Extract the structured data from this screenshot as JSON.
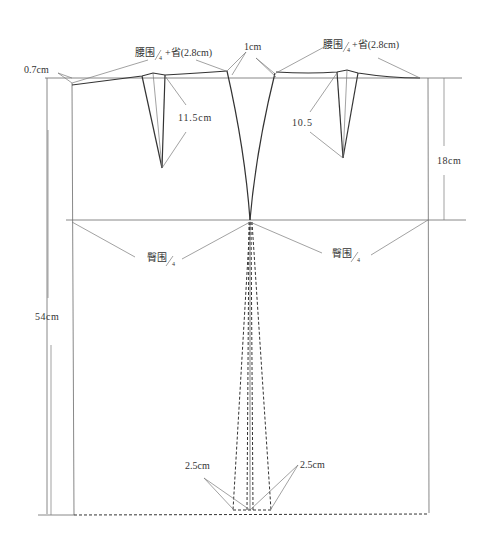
{
  "diagram": {
    "type": "skirt-pattern-draft",
    "colors": {
      "line": "#6a6a6a",
      "bold_line": "#333333",
      "text": "#333333",
      "background": "#ffffff"
    },
    "labels": {
      "waist_left": {
        "main": "腰围",
        "frac": "4",
        "suffix": "+省(2.8cm)"
      },
      "waist_right": {
        "main": "腰围",
        "frac": "4",
        "suffix": "+省(2.8cm)"
      },
      "side_raise": "0.7cm",
      "center_raise": "1cm",
      "dart_left_length": "11.5cm",
      "dart_right_length": "10.5",
      "hip_depth": "18cm",
      "hip_left": {
        "main": "臀围",
        "frac": "4"
      },
      "hip_right": {
        "main": "臀围",
        "frac": "4"
      },
      "skirt_length": "54cm",
      "hem_left_flare": "2.5cm",
      "hem_right_flare": "2.5cm"
    }
  }
}
